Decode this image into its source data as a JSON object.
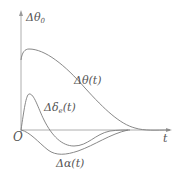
{
  "diagram": {
    "axes": {
      "y_label_main": "Δθ",
      "y_label_sub": "0",
      "x_label": "t",
      "origin_label": "O"
    },
    "curves": [
      {
        "id": "delta-theta",
        "label_main": "Δθ(t)",
        "label_sub": "",
        "label_suffix": "",
        "color": "#777777"
      },
      {
        "id": "delta-delta-e",
        "label_main": "Δδ",
        "label_sub": "e",
        "label_suffix": "(t)",
        "color": "#777777"
      },
      {
        "id": "delta-alpha",
        "label_main": "Δα(t)",
        "label_sub": "",
        "label_suffix": "",
        "color": "#777777"
      }
    ],
    "colors": {
      "axis": "#999999",
      "curve": "#7a7a7a",
      "text": "#555555"
    }
  }
}
